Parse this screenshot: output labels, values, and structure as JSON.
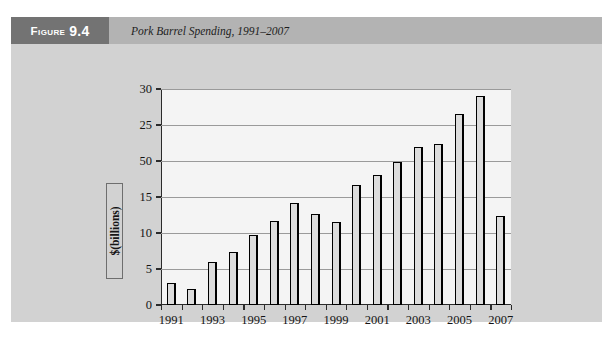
{
  "figure": {
    "badge_word": "Figure",
    "badge_number": "9.4",
    "caption": "Pork Barrel Spending, 1991–2007"
  },
  "colors": {
    "card_background": "#d2d2d2",
    "header_band": "#b3b3b3",
    "badge_background": "#737373",
    "badge_text": "#ffffff",
    "plot_background": "#f4f4f4",
    "bar_fill": "#dcdcdc",
    "bar_outline": "#000000",
    "gridline": "#9a9a9a",
    "axis": "#2b2b2b"
  },
  "chart_data": {
    "type": "bar",
    "title": "Pork Barrel Spending, 1991–2007",
    "xlabel": "",
    "ylabel": "$(billions)",
    "ylim": [
      0,
      30
    ],
    "ytick_values": [
      0,
      5,
      10,
      15,
      20,
      25,
      30
    ],
    "ytick_labels": [
      "0",
      "5",
      "10",
      "15",
      "50",
      "25",
      "30"
    ],
    "grid": true,
    "legend": null,
    "categories": [
      "1991",
      "1992",
      "1993",
      "1994",
      "1995",
      "1996",
      "1997",
      "1998",
      "1999",
      "2000",
      "2001",
      "2002",
      "2003",
      "2004",
      "2005",
      "2006",
      "2007"
    ],
    "xtick_labels": [
      "1991",
      "1993",
      "1995",
      "1997",
      "1999",
      "2001",
      "2003",
      "2005",
      "2007"
    ],
    "values": [
      3.1,
      2.2,
      6.0,
      7.4,
      9.7,
      11.6,
      14.1,
      12.7,
      11.5,
      16.6,
      18.1,
      19.8,
      22.0,
      22.4,
      26.5,
      29.0,
      12.4
    ]
  }
}
